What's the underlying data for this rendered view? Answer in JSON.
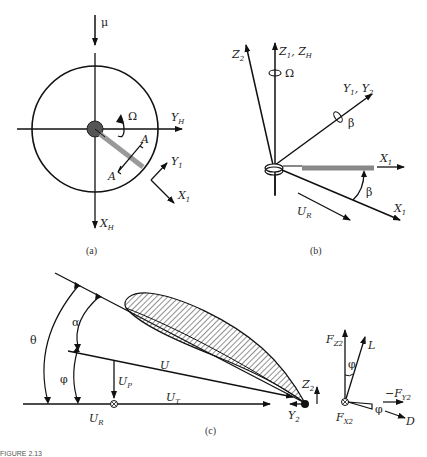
{
  "figure": {
    "caption": "FIGURE 2.13",
    "panels": [
      {
        "id": "a",
        "label": "(a)",
        "axes": [
          "Y_H",
          "X_H",
          "Y_1",
          "X_1"
        ],
        "symbols": {
          "mu": "μ",
          "omega": "Ω",
          "section": "A"
        }
      },
      {
        "id": "b",
        "label": "(b)",
        "axes": [
          "Z_1, Z_H",
          "Z_2",
          "Y_1, Y_2",
          "X_1",
          "X_1"
        ],
        "symbols": {
          "omega": "Ω",
          "beta": "β",
          "ur": "U_R"
        }
      },
      {
        "id": "c",
        "label": "(c)",
        "angles": [
          "θ",
          "α",
          "φ"
        ],
        "velocities": [
          "U",
          "U_P",
          "U_T",
          "U_R"
        ],
        "axes": [
          "Z_2",
          "Y_2"
        ],
        "forces": [
          "F_Z2",
          "L",
          "−F_Y2",
          "F_X2",
          "D"
        ],
        "force_angle": "φ"
      }
    ]
  },
  "text": {
    "mu": "μ",
    "omega": "Ω",
    "beta": "β",
    "theta": "θ",
    "alpha": "α",
    "phi": "φ",
    "A": "A",
    "X": "X",
    "Y": "Y",
    "Z": "Z",
    "U": "U",
    "F": "F",
    "L": "L",
    "D": "D",
    "sub_H": "H",
    "sub_1": "1",
    "sub_2": "2",
    "sub_R": "R",
    "sub_P": "P",
    "sub_T": "T",
    "sub_Z2": "Z2",
    "sub_Y2": "Y2",
    "sub_X2": "X2",
    "comma": ", ",
    "minus": "−",
    "label_a": "(a)",
    "label_b": "(b)",
    "label_c": "(c)",
    "caption": "FIGURE 2.13"
  }
}
